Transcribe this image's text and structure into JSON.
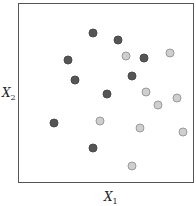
{
  "chart_data": {
    "type": "scatter",
    "title": "",
    "xlabel": "X1",
    "ylabel": "X2",
    "grid": false,
    "legend": null,
    "xlim": [
      0,
      1
    ],
    "ylim": [
      0,
      1
    ],
    "series": [
      {
        "name": "class-dark",
        "color": "#555555",
        "points": [
          {
            "x": 0.42,
            "y": 0.84
          },
          {
            "x": 0.56,
            "y": 0.8
          },
          {
            "x": 0.28,
            "y": 0.69
          },
          {
            "x": 0.71,
            "y": 0.7
          },
          {
            "x": 0.32,
            "y": 0.58
          },
          {
            "x": 0.64,
            "y": 0.6
          },
          {
            "x": 0.5,
            "y": 0.5
          },
          {
            "x": 0.2,
            "y": 0.34
          },
          {
            "x": 0.42,
            "y": 0.2
          }
        ]
      },
      {
        "name": "class-light",
        "color": "#cfcfcf",
        "points": [
          {
            "x": 0.61,
            "y": 0.71
          },
          {
            "x": 0.86,
            "y": 0.73
          },
          {
            "x": 0.72,
            "y": 0.51
          },
          {
            "x": 0.9,
            "y": 0.48
          },
          {
            "x": 0.79,
            "y": 0.44
          },
          {
            "x": 0.46,
            "y": 0.35
          },
          {
            "x": 0.69,
            "y": 0.31
          },
          {
            "x": 0.93,
            "y": 0.29
          },
          {
            "x": 0.64,
            "y": 0.1
          }
        ]
      }
    ]
  },
  "axes": {
    "x_label_main": "X",
    "x_label_sub": "1",
    "y_label_main": "X",
    "y_label_sub": "2"
  }
}
